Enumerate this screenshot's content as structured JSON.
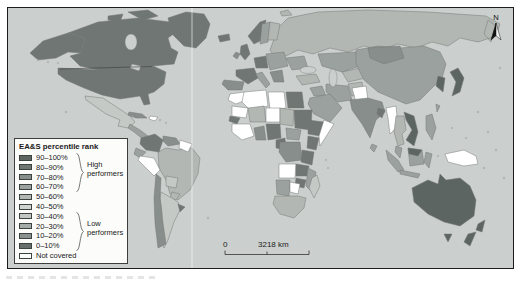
{
  "figure": {
    "legend": {
      "title": "EA&S percentile rank",
      "items": [
        {
          "label": "90–100%",
          "color": "#5d6563"
        },
        {
          "label": "80–90%",
          "color": "#6f7674"
        },
        {
          "label": "70–80%",
          "color": "#878e8b"
        },
        {
          "label": "60–70%",
          "color": "#9aa19e"
        },
        {
          "label": "50–60%",
          "color": "#b2b7b4"
        },
        {
          "label": "40–50%",
          "color": "#d0d4d1"
        },
        {
          "label": "30–40%",
          "color": "#c2c6c3"
        },
        {
          "label": "20–30%",
          "color": "#a5aba8"
        },
        {
          "label": "10–20%",
          "color": "#8a918e"
        },
        {
          "label": "0–10%",
          "color": "#686f6d"
        },
        {
          "label": "Not covered",
          "color": "#ffffff"
        }
      ],
      "high_group_label": "High performers",
      "low_group_label": "Low performers"
    },
    "scale_bar": {
      "zero_label": "0",
      "distance_label": "3218 km"
    },
    "north_arrow_label": "N",
    "map": {
      "ocean_color": "#cbcfcd",
      "land_border_color": "#747976",
      "fills": {
        "alaska": "#6f7674",
        "canada": "#6f7674",
        "usa": "#6f7674",
        "greenland": "#6f7674",
        "mexico": "#c5c9c6",
        "central-america": "#9aa19e",
        "cuba": "#878e8b",
        "hispaniola": "#ffffff",
        "colombia": "#6f7674",
        "venezuela": "#878e8b",
        "guianas": "#ffffff",
        "ecuador": "#9aa19e",
        "peru": "#ffffff",
        "brazil": "#b2b7b4",
        "bolivia": "#c5c9c6",
        "paraguay": "#b2b7b4",
        "chile": "#878e8b",
        "argentina": "#c5c9c6",
        "uruguay": "#6f7674",
        "iceland": "#6f7674",
        "uk": "#6f7674",
        "ireland": "#878e8b",
        "norway": "#6f7674",
        "sweden": "#9aa19e",
        "finland": "#b2b7b4",
        "france": "#6f7674",
        "spain": "#878e8b",
        "germany": "#6f7674",
        "italy": "#9aa19e",
        "e-europe": "#9aa19e",
        "balkans": "#878e8b",
        "russia": "#b2b7b4",
        "ukraine": "#9aa19e",
        "kazakhstan": "#9aa19e",
        "central-asia": "#b2b7b4",
        "turkey": "#b2b7b4",
        "iraq": "#9aa19e",
        "saudi": "#9aa19e",
        "iran": "#9aa19e",
        "afghanistan": "#b2b7b4",
        "morocco": "#ffffff",
        "algeria": "#ffffff",
        "libya": "#ffffff",
        "egypt": "#6f7674",
        "mauritania": "#ffffff",
        "mali": "#b2b7b4",
        "niger": "#ffffff",
        "chad": "#b2b7b4",
        "sudan": "#6f7674",
        "senegal": "#6f7674",
        "west-africa": "#ffffff",
        "ghana": "#878e8b",
        "nigeria": "#6f7674",
        "cameroon": "#6f7674",
        "car": "#9aa19e",
        "ethiopia": "#6f7674",
        "somalia": "#ffffff",
        "kenya": "#6f7674",
        "drc": "#878e8b",
        "tanzania": "#6f7674",
        "angola": "#ffffff",
        "zambia": "#6f7674",
        "mozambique": "#9aa19e",
        "zimbabwe": "#6f7674",
        "namibia": "#9aa19e",
        "botswana": "#ffffff",
        "south-africa": "#b2b7b4",
        "madagascar": "#c5c9c6",
        "pakistan": "#ffffff",
        "india": "#878e8b",
        "bangladesh": "#6f7674",
        "sri-lanka": "#9aa19e",
        "china": "#9aa19e",
        "mongolia": "#878e8b",
        "korea": "#5d6563",
        "japan": "#5d6563",
        "myanmar": "#ffffff",
        "thailand": "#b2b7b4",
        "vietnam": "#5d6563",
        "malaysia": "#9aa19e",
        "sumatra": "#9aa19e",
        "borneo": "#9aa19e",
        "borneo-my": "#5d6563",
        "java": "#9aa19e",
        "sulawesi": "#9aa19e",
        "philippines": "#9aa19e",
        "taiwan": "#9aa19e",
        "new-guinea": "#ffffff",
        "australia": "#5d6563",
        "tasmania": "#5d6563",
        "nz-north": "#5d6563",
        "nz-south": "#5d6563",
        "svalbard": "#b2b7b4"
      }
    }
  }
}
